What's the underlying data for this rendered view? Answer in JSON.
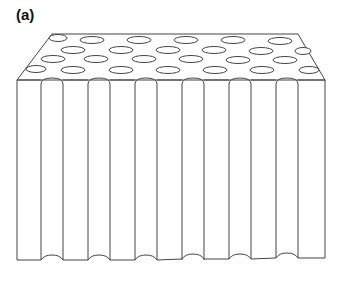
{
  "figure": {
    "panel_label": "(a)",
    "colors": {
      "stroke": "#444444",
      "fill": "#ffffff",
      "label": "#111111"
    },
    "top_face": {
      "hole_rows": 4,
      "holes_per_row": [
        6,
        6,
        6,
        6
      ]
    },
    "front_face": {
      "channel_count": 6
    }
  }
}
